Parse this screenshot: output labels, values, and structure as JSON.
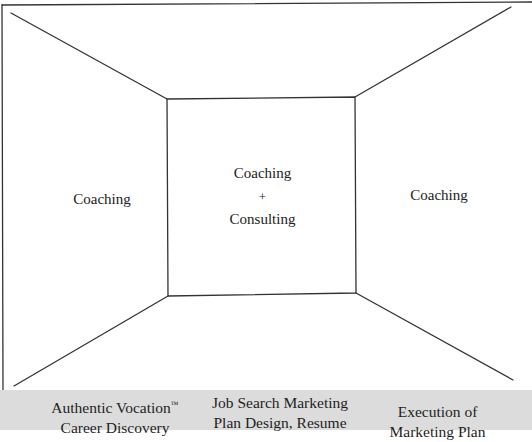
{
  "diagram": {
    "line_color": "#333333",
    "band_color": "#dcdcdc",
    "regions": {
      "left": {
        "label": "Coaching"
      },
      "center": {
        "line1": "Coaching",
        "connector": "+",
        "line2": "Consulting"
      },
      "right": {
        "label": "Coaching"
      }
    },
    "phases": [
      {
        "line1": "Authentic Vocation",
        "trademark": "™",
        "line2": "Career Discovery"
      },
      {
        "line1": "Job Search Marketing",
        "line2": "Plan Design, Resume"
      },
      {
        "line1": "Execution of",
        "line2": "Marketing Plan"
      }
    ]
  }
}
